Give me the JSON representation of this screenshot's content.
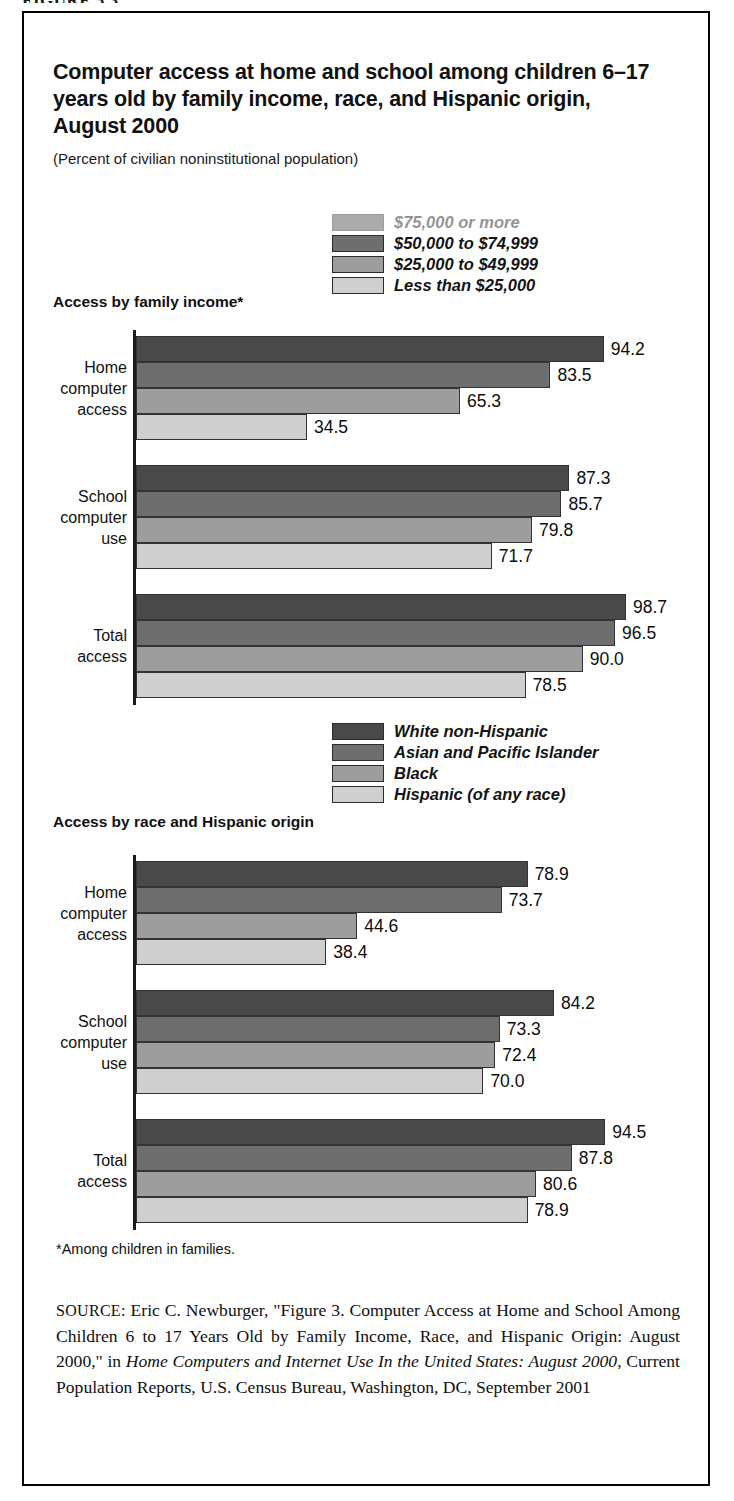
{
  "figure_head": "FIGURE 5.3",
  "title": "Computer access at home and school among children 6–17 years old by family income, race, and Hispanic origin, August 2000",
  "subtitle": "(Percent of civilian noninstitutional population)",
  "section1_label": "Access by family income*",
  "section2_label": "Access by race and Hispanic origin",
  "footnote": "*Among children in families.",
  "source": {
    "kicker": "SOURCE:",
    "part1": " Eric C. Newburger, \"Figure 3. Computer Access at Home and School Among Children 6 to 17 Years Old by Family Income, Race, and Hispanic Origin: August 2000,\" in ",
    "italic1": "Home Computers and Internet Use In the United States: August 2000",
    "part2": ", Current Population Reports, U.S. Census Bureau, Washington, DC, September 2001"
  },
  "colors": {
    "series1": "#494949",
    "series2": "#6e6e6e",
    "series3": "#9d9d9d",
    "series4": "#cfcfcf",
    "border": "#000000",
    "text": "#111111"
  },
  "chart_data": [
    {
      "type": "bar",
      "orientation": "horizontal",
      "title": "Access by family income*",
      "xlabel": "",
      "ylabel": "",
      "xlim": [
        0,
        100
      ],
      "grid": false,
      "legend_position": "top-center",
      "categories": [
        "Home computer access",
        "School computer use",
        "Total access"
      ],
      "category_lines": [
        [
          "Home",
          "computer",
          "access"
        ],
        [
          "School",
          "computer",
          "use"
        ],
        [
          "Total",
          "access"
        ]
      ],
      "series": [
        {
          "name": "$75,000 or more",
          "color": "#494949",
          "values": [
            94.2,
            87.3,
            98.7
          ]
        },
        {
          "name": "$50,000 to $74,999",
          "color": "#6e6e6e",
          "values": [
            83.5,
            85.7,
            96.5
          ]
        },
        {
          "name": "$25,000 to $49,999",
          "color": "#9d9d9d",
          "values": [
            65.3,
            79.8,
            90.0
          ]
        },
        {
          "name": "Less than $25,000",
          "color": "#cfcfcf",
          "values": [
            34.5,
            71.7,
            78.5
          ]
        }
      ],
      "value_labels": [
        [
          "94.2",
          "83.5",
          "65.3",
          "34.5"
        ],
        [
          "87.3",
          "85.7",
          "79.8",
          "71.7"
        ],
        [
          "98.7",
          "96.5",
          "90.0",
          "78.5"
        ]
      ]
    },
    {
      "type": "bar",
      "orientation": "horizontal",
      "title": "Access by race and Hispanic origin",
      "xlabel": "",
      "ylabel": "",
      "xlim": [
        0,
        100
      ],
      "grid": false,
      "legend_position": "top-center",
      "categories": [
        "Home computer access",
        "School computer use",
        "Total access"
      ],
      "category_lines": [
        [
          "Home",
          "computer",
          "access"
        ],
        [
          "School",
          "computer",
          "use"
        ],
        [
          "Total",
          "access"
        ]
      ],
      "series": [
        {
          "name": "White non-Hispanic",
          "color": "#494949",
          "values": [
            78.9,
            84.2,
            94.5
          ]
        },
        {
          "name": "Asian and Pacific Islander",
          "color": "#6e6e6e",
          "values": [
            73.7,
            73.3,
            87.8
          ]
        },
        {
          "name": "Black",
          "color": "#9d9d9d",
          "values": [
            44.6,
            72.4,
            80.6
          ]
        },
        {
          "name": "Hispanic (of any race)",
          "color": "#cfcfcf",
          "values": [
            38.4,
            70.0,
            78.9
          ]
        }
      ],
      "value_labels": [
        [
          "78.9",
          "73.7",
          "44.6",
          "38.4"
        ],
        [
          "84.2",
          "73.3",
          "72.4",
          "70.0"
        ],
        [
          "94.5",
          "87.8",
          "80.6",
          "78.9"
        ]
      ]
    }
  ]
}
